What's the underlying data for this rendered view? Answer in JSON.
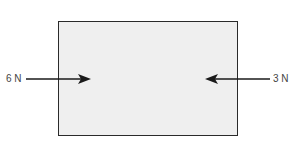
{
  "diagram": {
    "type": "free-body diagram",
    "object": "box",
    "forces": [
      {
        "label": "6 N",
        "direction": "right",
        "applied_side": "left"
      },
      {
        "label": "3 N",
        "direction": "left",
        "applied_side": "right"
      }
    ],
    "colors": {
      "box_fill": "#efefef",
      "outline": "#2a2a2a",
      "arrow": "#1a1a1a",
      "text": "#444444"
    }
  }
}
